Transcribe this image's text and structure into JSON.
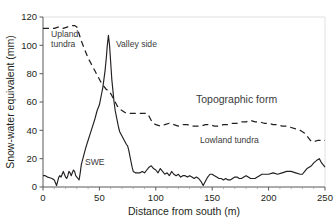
{
  "chart_data": {
    "type": "line",
    "title": "",
    "xlabel": "Distance from south (m)",
    "ylabel": "Snow-water equivalent (mm)",
    "xlim": [
      0,
      250
    ],
    "ylim": [
      0,
      120
    ],
    "xticks": [
      0,
      50,
      100,
      150,
      200,
      250
    ],
    "yticks": [
      0,
      20,
      40,
      60,
      80,
      100,
      120
    ],
    "grid": false,
    "legend_position": "none",
    "series": [
      {
        "name": "SWE",
        "style": "solid",
        "color": "#231f20",
        "points": [
          [
            0,
            8
          ],
          [
            2,
            8
          ],
          [
            4,
            7
          ],
          [
            6,
            6.5
          ],
          [
            8,
            6
          ],
          [
            10,
            5
          ],
          [
            11,
            3
          ],
          [
            12,
            1
          ],
          [
            13,
            4
          ],
          [
            14,
            7
          ],
          [
            15,
            8
          ],
          [
            16,
            7
          ],
          [
            17,
            9
          ],
          [
            18,
            11
          ],
          [
            19,
            9
          ],
          [
            20,
            7
          ],
          [
            21,
            6
          ],
          [
            22,
            8
          ],
          [
            23,
            11
          ],
          [
            24,
            10
          ],
          [
            25,
            8
          ],
          [
            26,
            10
          ],
          [
            27,
            12
          ],
          [
            28,
            11
          ],
          [
            29,
            8
          ],
          [
            30,
            7
          ],
          [
            31,
            6
          ],
          [
            32,
            5
          ],
          [
            33,
            10
          ],
          [
            34,
            16
          ],
          [
            36,
            22
          ],
          [
            38,
            28
          ],
          [
            40,
            33
          ],
          [
            42,
            38
          ],
          [
            44,
            43
          ],
          [
            46,
            48
          ],
          [
            48,
            54
          ],
          [
            50,
            58
          ],
          [
            51,
            62
          ],
          [
            52,
            66
          ],
          [
            53,
            70
          ],
          [
            54,
            76
          ],
          [
            55,
            82
          ],
          [
            56,
            90
          ],
          [
            57,
            100
          ],
          [
            58,
            107
          ],
          [
            59,
            100
          ],
          [
            60,
            88
          ],
          [
            61,
            76
          ],
          [
            62,
            68
          ],
          [
            63,
            60
          ],
          [
            64,
            54
          ],
          [
            65,
            50
          ],
          [
            66,
            46
          ],
          [
            67,
            42
          ],
          [
            68,
            39
          ],
          [
            70,
            36
          ],
          [
            72,
            33
          ],
          [
            74,
            30
          ],
          [
            75,
            29
          ],
          [
            76,
            26
          ],
          [
            77,
            22
          ],
          [
            78,
            18
          ],
          [
            79,
            14
          ],
          [
            80,
            11
          ],
          [
            82,
            10
          ],
          [
            84,
            10
          ],
          [
            86,
            10
          ],
          [
            88,
            11
          ],
          [
            90,
            10
          ],
          [
            92,
            12
          ],
          [
            94,
            14
          ],
          [
            96,
            15
          ],
          [
            98,
            13
          ],
          [
            100,
            12
          ],
          [
            102,
            10
          ],
          [
            104,
            13
          ],
          [
            106,
            11
          ],
          [
            108,
            9
          ],
          [
            110,
            10
          ],
          [
            112,
            8
          ],
          [
            114,
            11
          ],
          [
            116,
            9
          ],
          [
            118,
            8
          ],
          [
            120,
            9
          ],
          [
            122,
            7
          ],
          [
            124,
            8
          ],
          [
            126,
            8
          ],
          [
            128,
            7
          ],
          [
            130,
            8
          ],
          [
            132,
            7
          ],
          [
            134,
            6
          ],
          [
            136,
            7
          ],
          [
            138,
            6
          ],
          [
            140,
            4
          ],
          [
            142,
            1
          ],
          [
            144,
            4
          ],
          [
            146,
            7
          ],
          [
            148,
            9
          ],
          [
            150,
            9
          ],
          [
            152,
            8
          ],
          [
            154,
            7
          ],
          [
            156,
            6
          ],
          [
            158,
            6
          ],
          [
            160,
            5
          ],
          [
            162,
            6
          ],
          [
            164,
            5
          ],
          [
            166,
            5
          ],
          [
            168,
            6
          ],
          [
            170,
            7
          ],
          [
            172,
            7
          ],
          [
            174,
            6
          ],
          [
            176,
            6
          ],
          [
            178,
            7
          ],
          [
            180,
            8
          ],
          [
            182,
            7
          ],
          [
            184,
            6
          ],
          [
            186,
            6
          ],
          [
            188,
            6
          ],
          [
            190,
            7
          ],
          [
            192,
            8
          ],
          [
            194,
            9
          ],
          [
            196,
            9
          ],
          [
            198,
            9
          ],
          [
            200,
            9
          ],
          [
            204,
            10
          ],
          [
            208,
            9
          ],
          [
            212,
            10
          ],
          [
            216,
            11
          ],
          [
            220,
            11
          ],
          [
            224,
            10
          ],
          [
            228,
            9
          ],
          [
            230,
            9
          ],
          [
            232,
            11
          ],
          [
            234,
            13
          ],
          [
            236,
            14
          ],
          [
            238,
            15
          ],
          [
            240,
            17
          ],
          [
            243,
            19
          ],
          [
            245,
            20
          ],
          [
            247,
            17
          ],
          [
            250,
            14
          ]
        ]
      },
      {
        "name": "Topographic form",
        "style": "dashed",
        "color": "#231f20",
        "points": [
          [
            0,
            112
          ],
          [
            6,
            112
          ],
          [
            10,
            112
          ],
          [
            14,
            113
          ],
          [
            18,
            112
          ],
          [
            22,
            113
          ],
          [
            26,
            114
          ],
          [
            28,
            114
          ],
          [
            30,
            113
          ],
          [
            32,
            108
          ],
          [
            34,
            103
          ],
          [
            36,
            99
          ],
          [
            38,
            95
          ],
          [
            40,
            91
          ],
          [
            42,
            88
          ],
          [
            44,
            85
          ],
          [
            46,
            82
          ],
          [
            48,
            79
          ],
          [
            50,
            76
          ],
          [
            52,
            73
          ],
          [
            54,
            71
          ],
          [
            56,
            69
          ],
          [
            58,
            68
          ],
          [
            60,
            66
          ],
          [
            62,
            63
          ],
          [
            64,
            60
          ],
          [
            66,
            57
          ],
          [
            68,
            55
          ],
          [
            70,
            54
          ],
          [
            72,
            53
          ],
          [
            74,
            52
          ],
          [
            76,
            52
          ],
          [
            78,
            52
          ],
          [
            80,
            52
          ],
          [
            82,
            52
          ],
          [
            84,
            52
          ],
          [
            86,
            52
          ],
          [
            88,
            52
          ],
          [
            90,
            52
          ],
          [
            92,
            52
          ],
          [
            94,
            50
          ],
          [
            96,
            47
          ],
          [
            98,
            45
          ],
          [
            100,
            44
          ],
          [
            104,
            43
          ],
          [
            108,
            44
          ],
          [
            112,
            45
          ],
          [
            116,
            44
          ],
          [
            120,
            43
          ],
          [
            124,
            44
          ],
          [
            128,
            44
          ],
          [
            132,
            43
          ],
          [
            136,
            43
          ],
          [
            140,
            43
          ],
          [
            144,
            44
          ],
          [
            148,
            44
          ],
          [
            152,
            43
          ],
          [
            156,
            43
          ],
          [
            160,
            44
          ],
          [
            164,
            44
          ],
          [
            168,
            45
          ],
          [
            172,
            45
          ],
          [
            176,
            46
          ],
          [
            180,
            46
          ],
          [
            184,
            47
          ],
          [
            188,
            46
          ],
          [
            192,
            46
          ],
          [
            196,
            45
          ],
          [
            200,
            45
          ],
          [
            204,
            44
          ],
          [
            208,
            44
          ],
          [
            212,
            43
          ],
          [
            216,
            43
          ],
          [
            220,
            42
          ],
          [
            224,
            41
          ],
          [
            228,
            40
          ],
          [
            230,
            39
          ],
          [
            232,
            38
          ],
          [
            234,
            36
          ],
          [
            236,
            34
          ],
          [
            238,
            32
          ],
          [
            240,
            32
          ],
          [
            244,
            33
          ],
          [
            248,
            33
          ],
          [
            250,
            33
          ]
        ]
      }
    ],
    "annotations": [
      {
        "text": "Upland tundra",
        "x": 8,
        "y": 100
      },
      {
        "text": "Valley side",
        "x": 76,
        "y": 100
      },
      {
        "text": "SWE",
        "x": 47,
        "y": 18
      },
      {
        "text": "Topographic form",
        "x": 155,
        "y": 53
      },
      {
        "text": "Lowland tundra",
        "x": 160,
        "y": 29
      }
    ]
  }
}
